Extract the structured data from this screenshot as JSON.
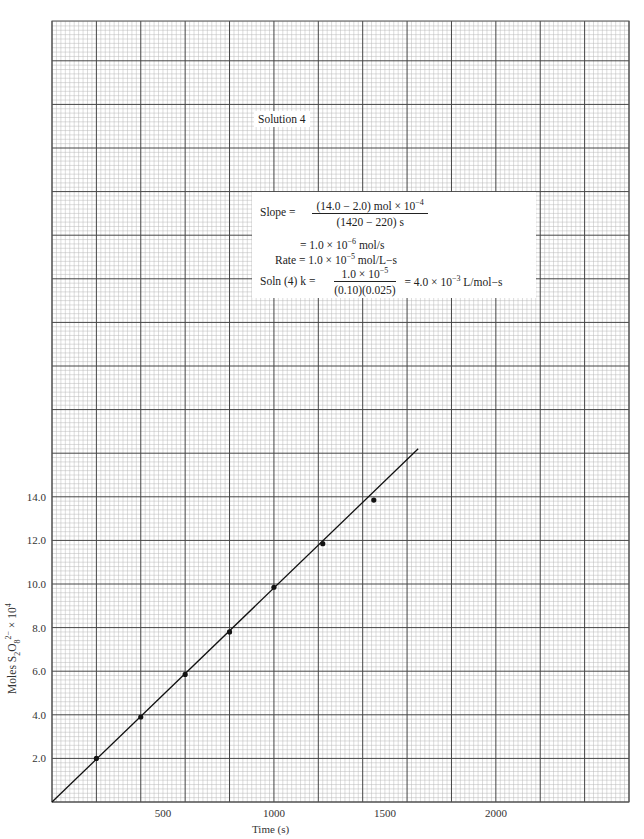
{
  "chart_data": {
    "type": "scatter",
    "title": "",
    "annotation_title": "Solution 4",
    "xlabel": "Time (s)",
    "ylabel": "Moles S2O8^2- × 10^4",
    "xlim": [
      0,
      2600
    ],
    "ylim": [
      0,
      36
    ],
    "grid": true,
    "x_ticks": [
      500,
      1000,
      1500,
      2000
    ],
    "y_ticks": [
      2.0,
      4.0,
      6.0,
      8.0,
      10.0,
      12.0,
      14.0
    ],
    "series": [
      {
        "name": "Solution 4 data",
        "x": [
          200,
          400,
          600,
          800,
          1000,
          1220,
          1450
        ],
        "y": [
          2.0,
          3.9,
          5.85,
          7.8,
          9.85,
          11.85,
          13.85
        ]
      }
    ],
    "fit_line": {
      "x": [
        0,
        1650
      ],
      "y": [
        0,
        16.2
      ]
    },
    "annotations": {
      "slope_numerator": "(14.0 − 2.0) mol × 10",
      "slope_numerator_exp": "−4",
      "slope_denominator": "(1420 − 220) s",
      "slope_result": "= 1.0 × 10",
      "slope_result_exp": "−6",
      "slope_result_unit": " mol/s",
      "rate_prefix": "Rate = 1.0 × 10",
      "rate_exp": "−5",
      "rate_unit": " mol/L−s",
      "k_prefix": "Soln (4) k  =",
      "k_numerator": "1.0 × 10",
      "k_numerator_exp": "−5",
      "k_denominator": "(0.10)(0.025)",
      "k_result": "= 4.0 × 10",
      "k_result_exp": "−3",
      "k_result_unit": " L/mol−s",
      "slope_label": "Slope ="
    }
  },
  "axes": {
    "xlabel": "Time (s)",
    "ylabel_main": "Moles S",
    "ylabel_sub1": "2",
    "ylabel_mid": "O",
    "ylabel_sub2": "8",
    "ylabel_sup": "2−",
    "ylabel_tail": " × 10",
    "ylabel_exp": "4",
    "x_tick_labels": [
      "500",
      "1000",
      "1500",
      "2000"
    ],
    "y_tick_labels": [
      "2.0",
      "4.0",
      "6.0",
      "8.0",
      "10.0",
      "12.0",
      "14.0"
    ]
  },
  "colors": {
    "minor_grid": "#b8b8b8",
    "major_grid": "#444444",
    "line": "#111111",
    "point": "#111111"
  }
}
